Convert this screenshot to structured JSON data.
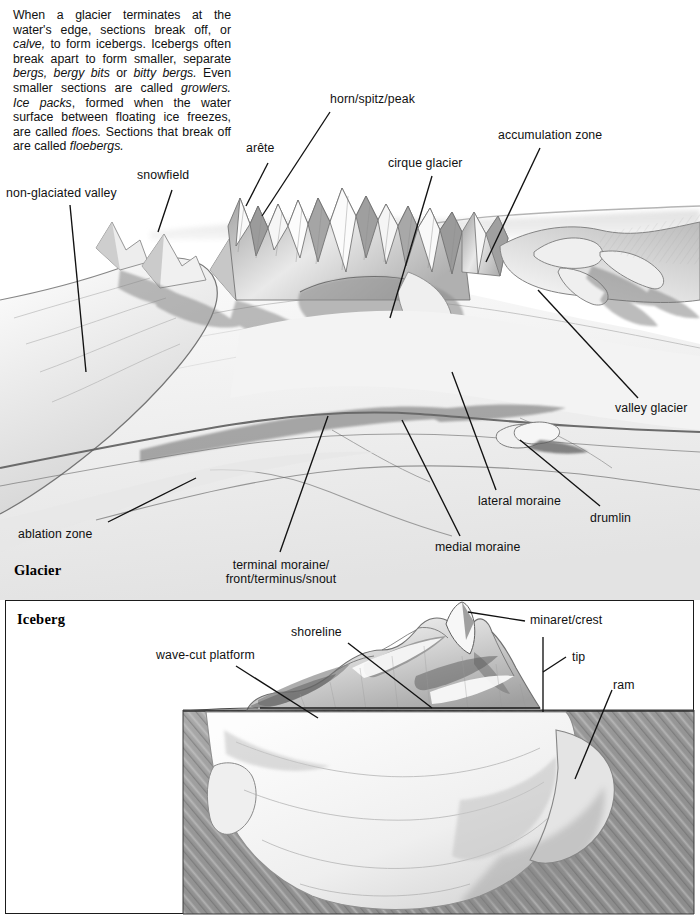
{
  "document": {
    "title": "Glacier and Iceberg features",
    "ink_color": "#111111",
    "paper_color": "#ffffff"
  },
  "intro": {
    "paragraph_plain": "When a glacier terminates at the water's edge, sections break off, or calve, to form icebergs. Icebergs often break apart to form smaller, separate bergs, bergy bits or bitty bergs. Even smaller sections are called growlers. Ice packs, formed when the water surface between floating ice freezes, are called floes. Sections that break off are called floebergs.",
    "runs": [
      {
        "t": "When a glacier terminates at the water's edge, sections break off, or ",
        "i": false
      },
      {
        "t": "calve,",
        "i": true
      },
      {
        "t": " to form icebergs. Icebergs often break apart to form smaller, separate ",
        "i": false
      },
      {
        "t": "bergs, bergy bits",
        "i": true
      },
      {
        "t": " or ",
        "i": false
      },
      {
        "t": "bitty bergs.",
        "i": true
      },
      {
        "t": " Even smaller sections are called ",
        "i": false
      },
      {
        "t": "growlers. Ice packs",
        "i": true
      },
      {
        "t": ", formed when the water surface between floating ice freezes, are called ",
        "i": false
      },
      {
        "t": "floes.",
        "i": true
      },
      {
        "t": " Sections that break off are called ",
        "i": false
      },
      {
        "t": "floebergs.",
        "i": true
      }
    ]
  },
  "glacier": {
    "caption": "Glacier",
    "labels": {
      "non_glaciated_valley": "non-glaciated valley",
      "snowfield": "snowfield",
      "arete": "arête",
      "horn": "horn/spitz/peak",
      "cirque_glacier": "cirque glacier",
      "accumulation_zone": "accumulation zone",
      "valley_glacier": "valley glacier",
      "lateral_moraine": "lateral moraine",
      "drumlin": "drumlin",
      "medial_moraine": "medial moraine",
      "terminal_moraine": "terminal moraine/\nfront/terminus/snout",
      "ablation_zone": "ablation zone"
    }
  },
  "iceberg": {
    "caption": "Iceberg",
    "labels": {
      "wave_cut_platform": "wave-cut platform",
      "shoreline": "shoreline",
      "minaret_crest": "minaret/crest",
      "tip": "tip",
      "ram": "ram"
    }
  }
}
